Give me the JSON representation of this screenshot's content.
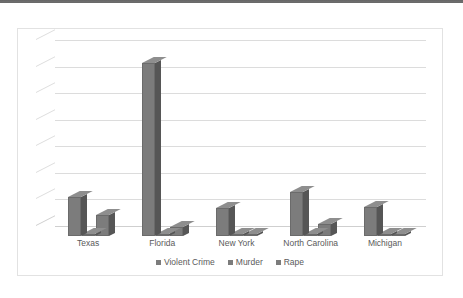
{
  "chart_data": {
    "type": "bar",
    "title": "",
    "subtitle": "",
    "xlabel": "",
    "ylabel": "",
    "categories": [
      "Texas",
      "Florida",
      "New York",
      "North Carolina",
      "Michigan"
    ],
    "series": [
      {
        "name": "Violent Crime",
        "color": "#7c7c7c",
        "values": [
          1.45,
          6.5,
          1.05,
          1.65,
          1.1
        ]
      },
      {
        "name": "Murder",
        "color": "#7c7c7c",
        "values": [
          0.08,
          0.05,
          0.04,
          0.06,
          0.03
        ]
      },
      {
        "name": "Rape",
        "color": "#7c7c7c",
        "values": [
          0.78,
          0.35,
          0.05,
          0.45,
          0.04
        ]
      }
    ],
    "ylim": [
      0,
      7
    ],
    "gridlines": 7,
    "grid": true,
    "y_tick_labels_visible": false,
    "legend_position": "bottom",
    "style": "3d-clustered-column-grayscale"
  },
  "legend": {
    "items": [
      {
        "label": "Violent Crime"
      },
      {
        "label": "Murder"
      },
      {
        "label": "Rape"
      }
    ]
  },
  "colors": {
    "bar_face": "#7c7c7c",
    "bar_side": "#565656",
    "bar_top": "#8e8e8e",
    "gridline": "#dcdcdc",
    "label_text": "#5a5a5a",
    "frame_border": "#e2e2e2",
    "top_strip": "#5e5e5e"
  }
}
